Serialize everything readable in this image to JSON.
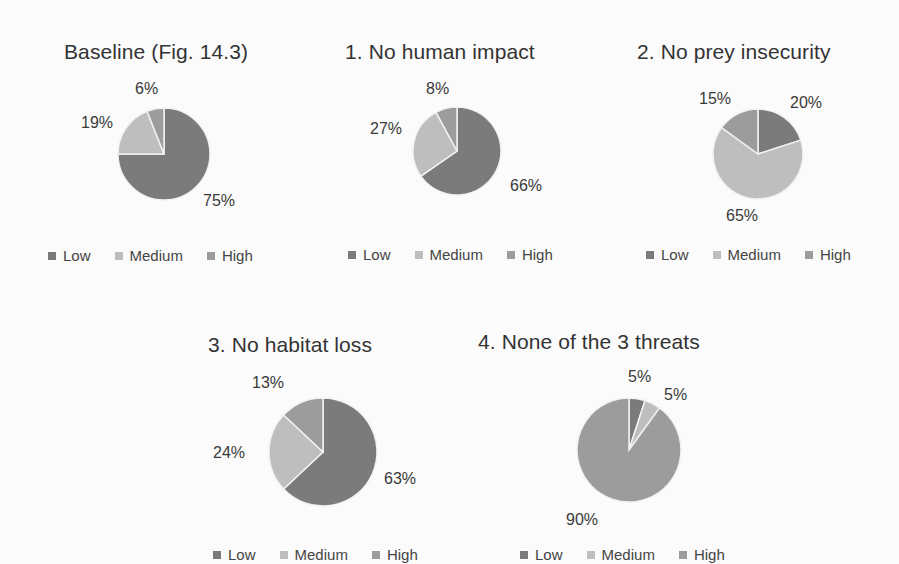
{
  "colors": {
    "Low": "#7b7b7b",
    "Medium": "#bebebe",
    "High": "#9c9c9c"
  },
  "legend_labels": [
    "Low",
    "Medium",
    "High"
  ],
  "chart_data": [
    {
      "type": "pie",
      "title": "Baseline (Fig. 14.3)",
      "categories": [
        "Low",
        "Medium",
        "High"
      ],
      "values": [
        75,
        19,
        6
      ],
      "data_labels": [
        "75%",
        "19%",
        "6%"
      ],
      "legend_position": "bottom"
    },
    {
      "type": "pie",
      "title": "1. No human impact",
      "categories": [
        "Low",
        "Medium",
        "High"
      ],
      "values": [
        66,
        27,
        8
      ],
      "data_labels": [
        "66%",
        "27%",
        "8%"
      ],
      "legend_position": "bottom"
    },
    {
      "type": "pie",
      "title": "2. No prey insecurity",
      "categories": [
        "Low",
        "Medium",
        "High"
      ],
      "values": [
        20,
        65,
        15
      ],
      "data_labels": [
        "20%",
        "65%",
        "15%"
      ],
      "legend_position": "bottom"
    },
    {
      "type": "pie",
      "title": "3. No habitat loss",
      "categories": [
        "Low",
        "Medium",
        "High"
      ],
      "values": [
        63,
        24,
        13
      ],
      "data_labels": [
        "63%",
        "24%",
        "13%"
      ],
      "legend_position": "bottom"
    },
    {
      "type": "pie",
      "title": "4. None of the 3 threats",
      "categories": [
        "Low",
        "Medium",
        "High"
      ],
      "values": [
        5,
        5,
        90
      ],
      "data_labels": [
        "5%",
        "5%",
        "90%"
      ],
      "legend_position": "bottom"
    }
  ]
}
